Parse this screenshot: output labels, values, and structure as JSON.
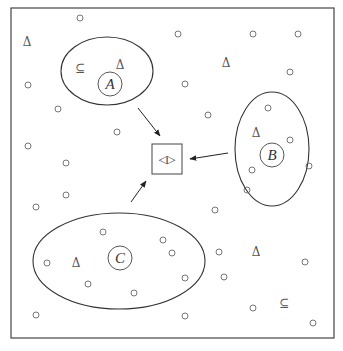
{
  "frame": {
    "x": 11,
    "y": 8,
    "w": 323,
    "h": 330,
    "stroke": "#444444"
  },
  "regions": [
    {
      "id": "A",
      "label": "A",
      "ellipse": {
        "cx": 107,
        "cy": 71,
        "rx": 46,
        "ry": 34
      },
      "inner": {
        "cx": 110,
        "cy": 84,
        "r": 12
      }
    },
    {
      "id": "B",
      "label": "B",
      "ellipse": {
        "cx": 272,
        "cy": 149,
        "rx": 37,
        "ry": 57
      },
      "inner": {
        "cx": 272,
        "cy": 155,
        "r": 12
      }
    },
    {
      "id": "C",
      "label": "C",
      "ellipse": {
        "cx": 119,
        "cy": 261,
        "rx": 86,
        "ry": 48
      },
      "inner": {
        "cx": 120,
        "cy": 258,
        "r": 12
      }
    }
  ],
  "center_box": {
    "x": 152,
    "y": 144,
    "w": 30,
    "h": 30,
    "symbol": "◁▷"
  },
  "arrows": [
    {
      "from": "A",
      "x1": 138,
      "y1": 108,
      "x2": 160,
      "y2": 136
    },
    {
      "from": "B",
      "x1": 228,
      "y1": 153,
      "x2": 190,
      "y2": 159
    },
    {
      "from": "C",
      "x1": 131,
      "y1": 202,
      "x2": 146,
      "y2": 181
    }
  ],
  "triangles": [
    {
      "x": 27,
      "y": 42
    },
    {
      "x": 120,
      "y": 65
    },
    {
      "x": 226,
      "y": 63
    },
    {
      "x": 256,
      "y": 133
    },
    {
      "x": 76,
      "y": 263
    },
    {
      "x": 256,
      "y": 252
    }
  ],
  "subset_symbols": [
    {
      "x": 80,
      "y": 68
    },
    {
      "x": 284,
      "y": 303
    }
  ],
  "circles": [
    [
      80,
      18
    ],
    [
      178,
      34
    ],
    [
      253,
      34
    ],
    [
      298,
      34
    ],
    [
      290,
      72
    ],
    [
      28,
      85
    ],
    [
      185,
      84
    ],
    [
      58,
      109
    ],
    [
      208,
      115
    ],
    [
      268,
      108
    ],
    [
      290,
      140
    ],
    [
      117,
      132
    ],
    [
      28,
      146
    ],
    [
      66,
      163
    ],
    [
      309,
      166
    ],
    [
      252,
      170
    ],
    [
      66,
      195
    ],
    [
      247,
      190
    ],
    [
      36,
      207
    ],
    [
      215,
      210
    ],
    [
      103,
      232
    ],
    [
      163,
      240
    ],
    [
      47,
      263
    ],
    [
      219,
      252
    ],
    [
      172,
      253
    ],
    [
      305,
      262
    ],
    [
      88,
      284
    ],
    [
      224,
      277
    ],
    [
      134,
      293
    ],
    [
      185,
      278
    ],
    [
      36,
      315
    ],
    [
      185,
      316
    ],
    [
      253,
      308
    ],
    [
      313,
      323
    ]
  ],
  "label_symbol": "Δ",
  "subset_glyph": "⊆"
}
